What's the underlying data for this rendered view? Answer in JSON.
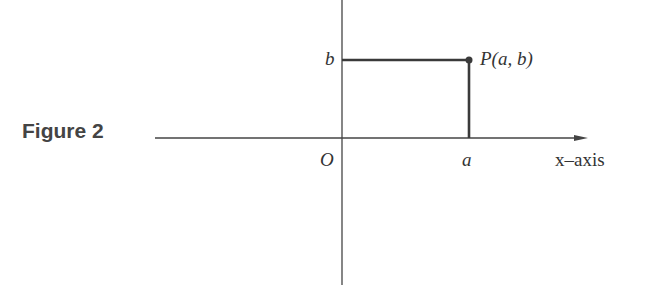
{
  "caption": "Figure 2",
  "labels": {
    "origin": "O",
    "x_tick": "a",
    "y_tick": "b",
    "point": "P(a, b)",
    "x_axis": "x–axis"
  },
  "colors": {
    "axis": "#444444",
    "segment": "#3a3a3a",
    "caption": "#444444"
  },
  "geometry": {
    "origin": [
      342,
      138
    ],
    "point": [
      469,
      60
    ],
    "x_axis_range": [
      155,
      588
    ],
    "y_axis_range": [
      0,
      285
    ]
  }
}
